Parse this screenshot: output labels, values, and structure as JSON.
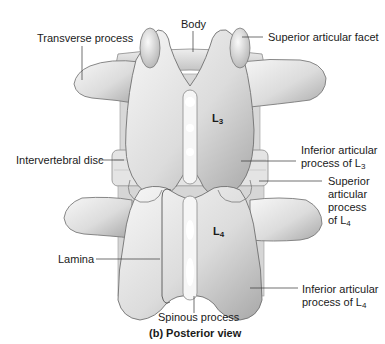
{
  "figure": {
    "caption": "(b) Posterior view",
    "vertebra_labels": [
      {
        "id": "L3",
        "base": "L",
        "sub": "3"
      },
      {
        "id": "L4",
        "base": "L",
        "sub": "4"
      }
    ],
    "labels": {
      "body": {
        "text": "Body"
      },
      "transverse_process": {
        "text": "Transverse process"
      },
      "superior_articular_facet": {
        "text": "Superior articular facet"
      },
      "intervertebral_disc": {
        "text": "Intervertebral disc"
      },
      "inferior_articular_process_L3": {
        "line1": "Inferior articular",
        "line2": "process of L",
        "sub": "3"
      },
      "superior_articular_process_L4": {
        "line1": "Superior",
        "line2": "articular",
        "line3": "process",
        "line4": "of L",
        "sub": "4"
      },
      "lamina": {
        "text": "Lamina"
      },
      "inferior_articular_process_L4": {
        "line1": "Inferior articular",
        "line2": "process of L",
        "sub": "4"
      },
      "spinous_process": {
        "text": "Spinous process"
      }
    },
    "colors": {
      "bone_light": "#f2f2f2",
      "bone_mid": "#d4d4d4",
      "bone_shadow": "#9a9a9a",
      "outline": "#7a7a7a",
      "leader": "#333333"
    }
  }
}
